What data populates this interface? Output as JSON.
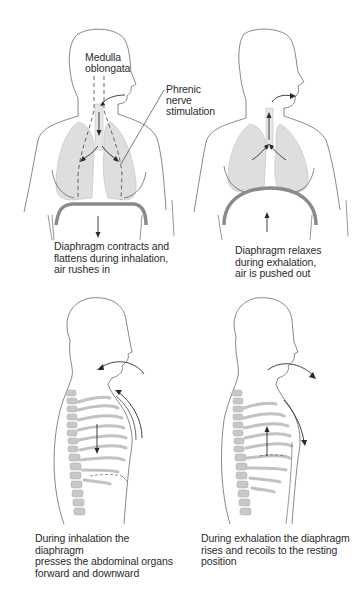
{
  "figure": {
    "panels": [
      {
        "id": "front-inhalation",
        "view": "front",
        "phase": "inhalation",
        "labels": {
          "medulla_line1": "Medulla",
          "medulla_line2": "oblongata",
          "phrenic_line1": "Phrenic nerve",
          "phrenic_line2": "stimulation"
        },
        "caption_lines": [
          "Diaphragm contracts and",
          "flattens during inhalation,",
          "air rushes in"
        ]
      },
      {
        "id": "front-exhalation",
        "view": "front",
        "phase": "exhalation",
        "caption_lines": [
          "Diaphragm relaxes",
          "during exhalation,",
          "air is pushed out"
        ]
      },
      {
        "id": "side-inhalation",
        "view": "side",
        "phase": "inhalation",
        "caption_lines": [
          "During inhalation the diaphragm",
          "presses the abdominal organs",
          "forward and downward"
        ]
      },
      {
        "id": "side-exhalation",
        "view": "side",
        "phase": "exhalation",
        "caption_lines": [
          "During exhalation the diaphragm",
          "rises and recoils to the resting",
          "position"
        ]
      }
    ],
    "colors": {
      "outline": "#6a6a6a",
      "lung_fill": "#dedede",
      "diaphragm": "#8a8a8a",
      "arrow": "#2a2a2a",
      "rib_fill": "#cfcfcf"
    }
  }
}
